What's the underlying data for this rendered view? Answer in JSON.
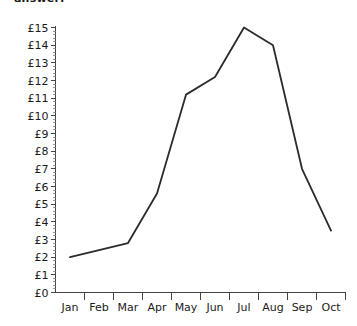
{
  "top_caption": "answer:",
  "colors": {
    "background": "#ffffff",
    "axis": "#444444",
    "minor_tick": "#7a7a7a",
    "series": "#2b2b2b",
    "text": "#1b1b1b"
  },
  "chart_data": {
    "type": "line",
    "title": "",
    "xlabel": "",
    "ylabel": "",
    "categories": [
      "Jan",
      "Feb",
      "Mar",
      "Apr",
      "May",
      "Jun",
      "Jul",
      "Aug",
      "Sep",
      "Oct"
    ],
    "series": [
      {
        "name": "",
        "values": [
          2.0,
          2.4,
          2.8,
          5.6,
          11.2,
          12.2,
          15.0,
          14.0,
          7.0,
          3.5
        ]
      }
    ],
    "ylim": [
      0,
      15
    ],
    "ytick_labels": [
      "£0",
      "£1",
      "£2",
      "£3",
      "£4",
      "£5",
      "£6",
      "£7",
      "£8",
      "£9",
      "£10",
      "£11",
      "£12",
      "£13",
      "£14",
      "£15"
    ],
    "ytick_values": [
      0,
      1,
      2,
      3,
      4,
      5,
      6,
      7,
      8,
      9,
      10,
      11,
      12,
      13,
      14,
      15
    ],
    "y_minor_per_major": 5,
    "currency_symbol": "£",
    "grid": false,
    "legend": false,
    "legend_position": "none"
  }
}
